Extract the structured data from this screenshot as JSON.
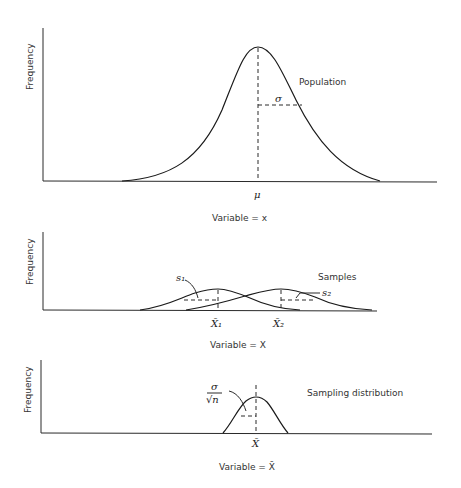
{
  "figure": {
    "panels": [
      {
        "id": "population",
        "ylabel": "Frequency",
        "xlabel": "Variable = x",
        "curve_label": "Population",
        "mean_label": "μ",
        "spread_label": "σ"
      },
      {
        "id": "samples",
        "ylabel": "Frequency",
        "xlabel": "Variable = X",
        "curve_label": "Samples",
        "mean_labels": [
          "X̄₁",
          "X̄₂"
        ],
        "spread_labels": [
          "s₁",
          "s₂"
        ]
      },
      {
        "id": "sampling-distribution",
        "ylabel": "Frequency",
        "xlabel": "Variable = X̄",
        "curve_label": "Sampling distribution",
        "mean_label": "X̄",
        "spread_label_num": "σ",
        "spread_label_den": "√n"
      }
    ],
    "colors": {
      "line": "#1a1a1a",
      "text": "#333333",
      "background": "#ffffff"
    }
  }
}
